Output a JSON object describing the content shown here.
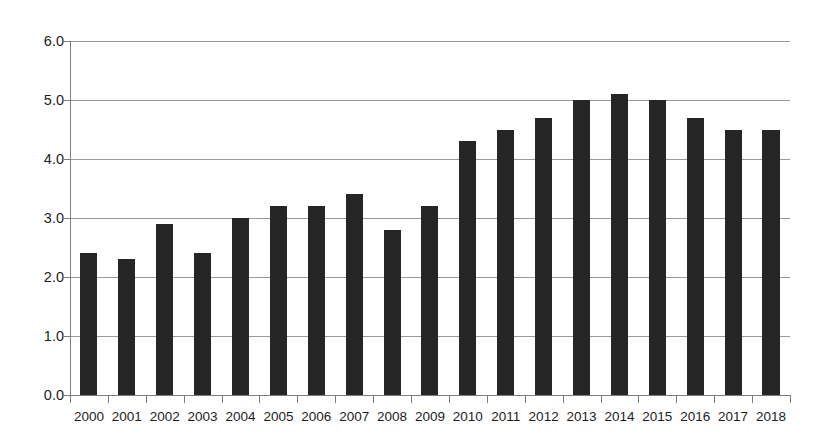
{
  "chart_data": {
    "type": "bar",
    "title": "",
    "subtitle": "",
    "xlabel": "",
    "ylabel": "",
    "categories": [
      "2000",
      "2001",
      "2002",
      "2003",
      "2004",
      "2005",
      "2006",
      "2007",
      "2008",
      "2009",
      "2010",
      "2011",
      "2012",
      "2013",
      "2014",
      "2015",
      "2016",
      "2017",
      "2018"
    ],
    "values": [
      2.4,
      2.3,
      2.9,
      2.4,
      3.0,
      3.2,
      3.2,
      3.4,
      2.8,
      3.2,
      4.3,
      4.5,
      4.7,
      5.0,
      5.1,
      5.0,
      4.7,
      4.5,
      4.5
    ],
    "series": [
      {
        "name": "",
        "values": [
          2.4,
          2.3,
          2.9,
          2.4,
          3.0,
          3.2,
          3.2,
          3.4,
          2.8,
          3.2,
          4.3,
          4.5,
          4.7,
          5.0,
          5.1,
          5.0,
          4.7,
          4.5,
          4.5
        ]
      }
    ],
    "ylim": [
      0,
      6
    ],
    "ytick_step": 1,
    "ytick_labels": [
      "0.0",
      "1.0",
      "2.0",
      "3.0",
      "4.0",
      "5.0",
      "6.0"
    ],
    "ytick_values": [
      0,
      1,
      2,
      3,
      4,
      5,
      6
    ],
    "grid": true,
    "grid_axis": "y",
    "legend": false,
    "legend_position": "none",
    "annotations": [],
    "colors": {
      "bar": "#262626",
      "gridline": "#9a9a9a",
      "axis": "#7d7d7d",
      "text": "#1d1d1d",
      "background": "#ffffff"
    }
  }
}
